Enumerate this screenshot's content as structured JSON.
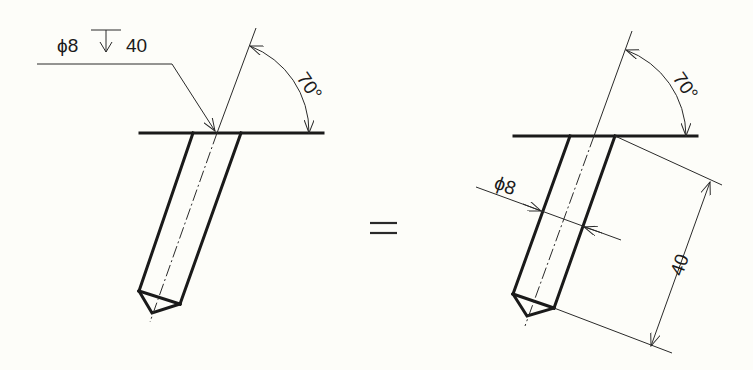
{
  "figure": {
    "background_color": "#fdfdf9",
    "line_color": "#1a1a1a"
  },
  "left_view": {
    "callout_diameter": "ϕ8",
    "depth_symbol": "↧",
    "callout_depth": "40",
    "angle_label": "70°"
  },
  "equals_sign": "=",
  "right_view": {
    "angle_label": "70°",
    "diameter_label": "ϕ8",
    "length_label": "40"
  }
}
